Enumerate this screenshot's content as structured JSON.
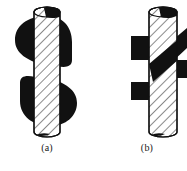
{
  "figure": {
    "background_color": "#ffffff",
    "ink_color": "#111111",
    "hatch_color": "#2a2a2a",
    "fill_color": "#ffffff",
    "panels": [
      {
        "id": "a",
        "caption": "(a)",
        "shape_name": "s-shaped-band-through-hatched-cylinder",
        "band_type": "S",
        "cylinder": {
          "left": 34,
          "right": 60,
          "top": 8,
          "bottom": 128,
          "ellipse_ry": 5,
          "hatch_angle_deg": -45,
          "hatch_spacing": 7
        },
        "band_color": "#111111"
      },
      {
        "id": "b",
        "caption": "(b)",
        "shape_name": "z-shaped-band-through-hatched-cylinder",
        "band_type": "Z",
        "cylinder": {
          "left": 56,
          "right": 84,
          "top": 8,
          "bottom": 128,
          "ellipse_ry": 5,
          "hatch_angle_deg": -45,
          "hatch_spacing": 7
        },
        "band_color": "#111111"
      }
    ]
  }
}
